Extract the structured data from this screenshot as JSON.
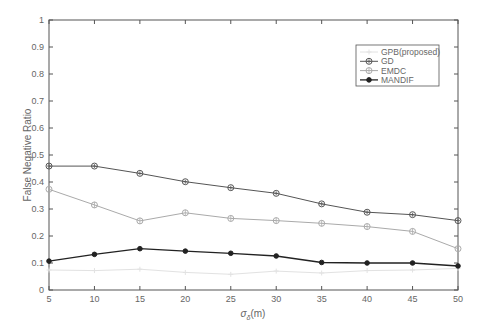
{
  "chart_data": {
    "type": "line",
    "title": "",
    "xlabel": "σδ(m)",
    "xlabel_main": "σ",
    "xlabel_sub": "δ",
    "xlabel_unit": "(m)",
    "ylabel": "False Negative Ratio",
    "xlim": [
      5,
      50
    ],
    "ylim": [
      0,
      1
    ],
    "grid": false,
    "legend_position": "upper right",
    "x": [
      5,
      10,
      15,
      20,
      25,
      30,
      35,
      40,
      45,
      50
    ],
    "xticks": [
      "5",
      "10",
      "15",
      "20",
      "25",
      "30",
      "35",
      "40",
      "45",
      "50"
    ],
    "yticks": [
      "0",
      "0.1",
      "0.2",
      "0.3",
      "0.4",
      "0.5",
      "0.6",
      "0.7",
      "0.8",
      "0.9",
      "1"
    ],
    "series": [
      {
        "name": "GPB(proposed)",
        "color": "#e2e2e2",
        "marker": "plus",
        "values": [
          0.074,
          0.072,
          0.077,
          0.065,
          0.058,
          0.07,
          0.063,
          0.072,
          0.074,
          0.08
        ]
      },
      {
        "name": "GD",
        "color": "#555555",
        "marker": "circle-cross",
        "values": [
          0.459,
          0.459,
          0.432,
          0.401,
          0.379,
          0.358,
          0.319,
          0.288,
          0.279,
          0.257
        ]
      },
      {
        "name": "EMDC",
        "color": "#aaaaaa",
        "marker": "circle-plus",
        "values": [
          0.373,
          0.315,
          0.256,
          0.286,
          0.265,
          0.257,
          0.247,
          0.235,
          0.217,
          0.153
        ]
      },
      {
        "name": "MANDIF",
        "color": "#222222",
        "marker": "dot",
        "values": [
          0.107,
          0.132,
          0.153,
          0.144,
          0.136,
          0.126,
          0.102,
          0.1,
          0.1,
          0.089
        ]
      }
    ]
  }
}
